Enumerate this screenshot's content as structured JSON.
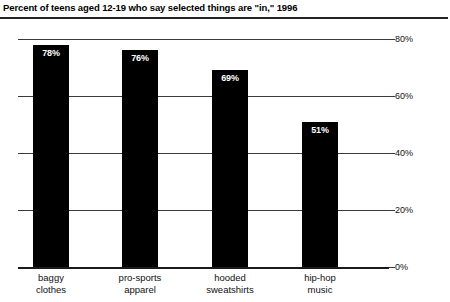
{
  "chart_data": {
    "type": "bar",
    "title": "Percent of teens aged 12-19 who say selected things are \"in,\" 1996",
    "xlabel": "",
    "ylabel": "",
    "ylim": [
      0,
      80
    ],
    "grid": true,
    "legend": "none",
    "orientation": "vertical",
    "bar_color": "#000000",
    "value_label_color": "#ffffff",
    "categories": [
      "baggy clothes",
      "pro-sports apparel",
      "hooded sweatshirts",
      "hip-hop music"
    ],
    "category_lines": [
      [
        "baggy",
        "clothes"
      ],
      [
        "pro-sports",
        "apparel"
      ],
      [
        "hooded",
        "sweatshirts"
      ],
      [
        "hip-hop",
        "music"
      ]
    ],
    "values": [
      78,
      76,
      69,
      51
    ],
    "value_labels": [
      "78%",
      "76%",
      "69%",
      "51%"
    ],
    "yticks": [
      0,
      20,
      40,
      60,
      80
    ],
    "ytick_labels": [
      "0%",
      "20%",
      "40%",
      "60%",
      "80%"
    ]
  },
  "axis": {
    "y": {
      "ticks": [
        {
          "value": 80,
          "label": "80%"
        },
        {
          "value": 60,
          "label": "60%"
        },
        {
          "value": 40,
          "label": "40%"
        },
        {
          "value": 20,
          "label": "20%"
        },
        {
          "value": 0,
          "label": "0%"
        }
      ]
    },
    "x": {
      "categories": [
        {
          "line1": "baggy",
          "line2": "clothes"
        },
        {
          "line1": "pro-sports",
          "line2": "apparel"
        },
        {
          "line1": "hooded",
          "line2": "sweatshirts"
        },
        {
          "line1": "hip-hop",
          "line2": "music"
        }
      ]
    }
  },
  "bars": [
    {
      "label": "baggy clothes",
      "value": 78,
      "value_label": "78%"
    },
    {
      "label": "pro-sports apparel",
      "value": 76,
      "value_label": "76%"
    },
    {
      "label": "hooded sweatshirts",
      "value": 69,
      "value_label": "69%"
    },
    {
      "label": "hip-hop music",
      "value": 51,
      "value_label": "51%"
    }
  ],
  "colors": {
    "bar": "#000000",
    "gridline": "#3a3a3a",
    "baseline": "#1a1a1a",
    "title_rule": "#222222",
    "text": "#111111",
    "background": "#ffffff"
  }
}
